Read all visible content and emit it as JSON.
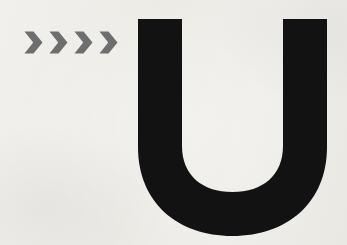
{
  "canvas": {
    "width": 347,
    "height": 245,
    "background_color": "#f7f6f4",
    "description": "Minimal graphic: four gray right-pointing chevrons to the left of a large bold black letter U"
  },
  "chevrons": {
    "name": "chevron-group",
    "count": 4,
    "glyph": "›",
    "color": "#6e6e6e",
    "label": ">>>>",
    "items": [
      {
        "label": ">",
        "x": 24
      },
      {
        "label": ">",
        "x": 49
      },
      {
        "label": ">",
        "x": 74
      },
      {
        "label": ">",
        "x": 99
      }
    ],
    "bounds": {
      "x": 24,
      "y": 31,
      "width": 98,
      "height": 23
    },
    "stroke_width": 9
  },
  "letter": {
    "name": "letter-u",
    "character": "U",
    "color": "#121212",
    "bounds": {
      "x": 138,
      "y": 19,
      "width": 189,
      "height": 216
    },
    "stem_width": 44,
    "left_stem_x": 138,
    "right_stem_x": 286,
    "counter_bottom_y": 195,
    "baseline_y": 235
  },
  "colors": {
    "background": "#f7f6f4",
    "ink_black": "#121212",
    "chevron_gray": "#6e6e6e"
  }
}
